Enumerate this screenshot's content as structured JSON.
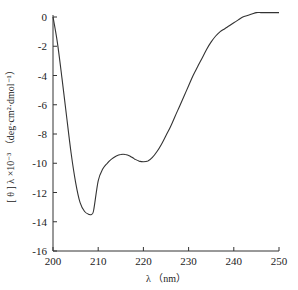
{
  "chart_data": {
    "type": "line",
    "title": "",
    "xlabel": "λ （nm）",
    "ylabel": "[ θ ] λ ×10⁻³ （deg·cm²·dmol⁻¹）",
    "xlim": [
      200,
      250
    ],
    "ylim": [
      -16,
      0
    ],
    "xticks": [
      200,
      210,
      220,
      230,
      240,
      250
    ],
    "yticks": [
      0,
      -2,
      -4,
      -6,
      -8,
      -10,
      -12,
      -14,
      -16
    ],
    "grid": false,
    "legend": null,
    "series": [
      {
        "name": "CD spectrum",
        "x": [
          200,
          201,
          202,
          203,
          204,
          205,
          206,
          207,
          208,
          208.5,
          209,
          210,
          211,
          212,
          213,
          214,
          215,
          216,
          217,
          218,
          219,
          220,
          221,
          222,
          223,
          224,
          225,
          226,
          227,
          228,
          229,
          230,
          231,
          232,
          233,
          234,
          235,
          236,
          237,
          238,
          239,
          240,
          241,
          242,
          243,
          244,
          245,
          246,
          247,
          248,
          249,
          250
        ],
        "y": [
          0,
          -1.8,
          -4.2,
          -6.8,
          -9.3,
          -11.3,
          -12.7,
          -13.3,
          -13.5,
          -13.5,
          -13.2,
          -11.2,
          -10.4,
          -10.0,
          -9.7,
          -9.5,
          -9.4,
          -9.4,
          -9.5,
          -9.7,
          -9.85,
          -9.9,
          -9.85,
          -9.6,
          -9.2,
          -8.7,
          -8.1,
          -7.5,
          -6.8,
          -6.1,
          -5.4,
          -4.7,
          -4.0,
          -3.4,
          -2.8,
          -2.2,
          -1.7,
          -1.3,
          -1.0,
          -0.8,
          -0.6,
          -0.4,
          -0.2,
          0.0,
          0.1,
          0.2,
          0.3,
          0.3,
          0.3,
          0.3,
          0.3,
          0.3
        ]
      }
    ]
  }
}
